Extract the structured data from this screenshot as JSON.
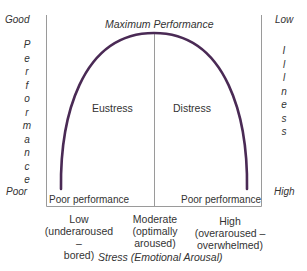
{
  "diagram": {
    "type": "inverted-u curve (Yerkes-Dodson stress-performance)",
    "curve_color": "#4a2a55",
    "axis_color": "#999999",
    "left_axis": {
      "top_label": "Good",
      "bottom_label": "Poor",
      "title_letters": [
        "P",
        "e",
        "r",
        "f",
        "o",
        "r",
        "m",
        "a",
        "n",
        "c",
        "e"
      ]
    },
    "right_axis": {
      "top_label": "Low",
      "bottom_label": "High",
      "title_letters": [
        "I",
        "l",
        "l",
        "n",
        "e",
        "s",
        "s"
      ]
    },
    "peak_label": "Maximum Performance",
    "regions": {
      "left": "Eustress",
      "right": "Distress"
    },
    "bottom_left_label": "Poor performance",
    "bottom_right_label": "Poor performance",
    "x_ticks": [
      {
        "line1": "Low",
        "line2": "(underaroused –",
        "line3": "bored)"
      },
      {
        "line1": "Moderate",
        "line2": "(optimally",
        "line3": "aroused)"
      },
      {
        "line1": "High",
        "line2": "(overaroused –",
        "line3": "overwhelmed)"
      }
    ],
    "x_axis_title": "Stress (Emotional Arousal)"
  }
}
